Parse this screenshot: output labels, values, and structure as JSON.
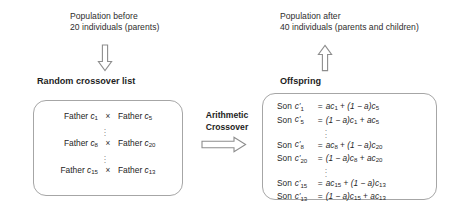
{
  "figure": {
    "background_color": "#ffffff",
    "box_border_color": "#a6a6a6",
    "text_color": "#2b2b2b"
  },
  "left_column": {
    "caption": {
      "line1": "Population before",
      "line2": "20 individuals (parents)"
    },
    "arrow": {
      "icon": "arrow-down-outline-icon",
      "direction": "down"
    },
    "section_title": "Random crossover list",
    "pairs": [
      {
        "left_label": "Father",
        "left_var": "c",
        "left_sub": "1",
        "operator": "×",
        "right_label": "Father",
        "right_var": "c",
        "right_sub": "5"
      },
      {
        "left_label": "Father",
        "left_var": "c",
        "left_sub": "8",
        "operator": "×",
        "right_label": "Father",
        "right_var": "c",
        "right_sub": "20"
      },
      {
        "left_label": "Father",
        "left_var": "c",
        "left_sub": "15",
        "operator": "×",
        "right_label": "Father",
        "right_var": "c",
        "right_sub": "13"
      }
    ],
    "ellipsis": "⋮"
  },
  "center": {
    "label_line1": "Arithmetic",
    "label_line2": "Crossover",
    "arrow": {
      "icon": "arrow-right-outline-icon",
      "direction": "right"
    }
  },
  "right_column": {
    "caption": {
      "line1": "Population after",
      "line2": "40 individuals (parents and children)"
    },
    "arrow": {
      "icon": "arrow-up-outline-icon",
      "direction": "up"
    },
    "section_title": "Offspring",
    "formulas": [
      {
        "label": "Son",
        "lhs_var": "c",
        "lhs_sub": "1",
        "lhs_prime": true,
        "eq": "=",
        "rhs": "ac₁ + (1 − a)c₅",
        "rhs_parts": {
          "term1_coef": "a",
          "term1_var": "c",
          "term1_sub": "1",
          "op": "+",
          "term2_coef": "(1 − a)",
          "term2_var": "c",
          "term2_sub": "5"
        }
      },
      {
        "label": "Son",
        "lhs_var": "c",
        "lhs_sub": "5",
        "lhs_prime": true,
        "eq": "=",
        "rhs": "(1 − a)c₁ + ac₅",
        "rhs_parts": {
          "term1_coef": "(1 − a)",
          "term1_var": "c",
          "term1_sub": "1",
          "op": "+",
          "term2_coef": "a",
          "term2_var": "c",
          "term2_sub": "5"
        }
      },
      {
        "label": "Son",
        "lhs_var": "c",
        "lhs_sub": "8",
        "lhs_prime": true,
        "eq": "=",
        "rhs": "ac₈ + (1 − a)c₂₀",
        "rhs_parts": {
          "term1_coef": "a",
          "term1_var": "c",
          "term1_sub": "8",
          "op": "+",
          "term2_coef": "(1 − a)",
          "term2_var": "c",
          "term2_sub": "20"
        }
      },
      {
        "label": "Son",
        "lhs_var": "c",
        "lhs_sub": "20",
        "lhs_prime": true,
        "eq": "=",
        "rhs": "(1 − a)c₈ + ac₂₀",
        "rhs_parts": {
          "term1_coef": "(1 − a)",
          "term1_var": "c",
          "term1_sub": "8",
          "op": "+",
          "term2_coef": "a",
          "term2_var": "c",
          "term2_sub": "20"
        }
      },
      {
        "label": "Son",
        "lhs_var": "c",
        "lhs_sub": "15",
        "lhs_prime": true,
        "eq": "=",
        "rhs": "ac₁₅ + (1 − a)c₁₃",
        "rhs_parts": {
          "term1_coef": "a",
          "term1_var": "c",
          "term1_sub": "15",
          "op": "+",
          "term2_coef": "(1 − a)",
          "term2_var": "c",
          "term2_sub": "13"
        }
      },
      {
        "label": "Son",
        "lhs_var": "c",
        "lhs_sub": "13",
        "lhs_prime": true,
        "eq": "=",
        "rhs": "(1 − a)c₁₅ + ac₁₃",
        "rhs_parts": {
          "term1_coef": "(1 − a)",
          "term1_var": "c",
          "term1_sub": "15",
          "op": "+",
          "term2_coef": "a",
          "term2_var": "c",
          "term2_sub": "13"
        }
      }
    ],
    "ellipsis": "⋮"
  }
}
